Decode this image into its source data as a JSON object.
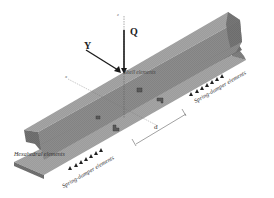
{
  "diagram": {
    "type": "rail-fe-model",
    "forces": {
      "vertical": "Q",
      "lateral": "Y"
    },
    "axes": {
      "z": "z",
      "x": "x"
    },
    "labels": {
      "shell": "Shell elements",
      "hexahedral": "Hexahedral elements",
      "spring_right": "Spring-damper elements",
      "spring_left": "Spring-damper elements",
      "spacing": "d"
    },
    "colors": {
      "rail": "#8a8a8a",
      "rail_dark": "#6e6e6e",
      "rail_light": "#a8a8a8",
      "arrow": "#1a1a1a",
      "support": "#222222"
    }
  }
}
